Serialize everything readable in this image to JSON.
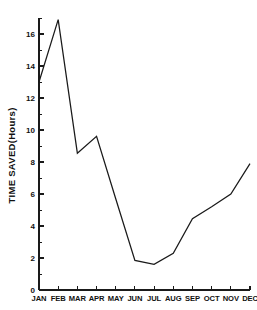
{
  "chart_data": {
    "type": "line",
    "title": "",
    "subtitle": "",
    "xlabel": "",
    "ylabel": "TIME SAVED(Hours)",
    "categories": [
      "JAN",
      "FEB",
      "MAR",
      "APR",
      "MAY",
      "JUN",
      "JUL",
      "AUG",
      "SEP",
      "OCT",
      "NOV",
      "DEC"
    ],
    "values": [
      13.0,
      16.9,
      8.55,
      9.6,
      5.7,
      1.85,
      1.6,
      2.3,
      4.45,
      5.2,
      6.0,
      7.9
    ],
    "series": [
      {
        "name": "Time Saved",
        "values": [
          13.0,
          16.9,
          8.55,
          9.6,
          5.7,
          1.85,
          1.6,
          2.3,
          4.45,
          5.2,
          6.0,
          7.9
        ],
        "color": "#1a1a1a"
      }
    ],
    "ylim": [
      0,
      17
    ],
    "xlim": [
      0,
      11
    ],
    "y_major_ticks": [
      0,
      2,
      4,
      6,
      8,
      10,
      12,
      14,
      16
    ],
    "y_major_tick_labels": [
      "0",
      "2",
      "4",
      "6",
      "8",
      "10",
      "12",
      "14",
      "16"
    ],
    "y_minor_ticks": [
      1,
      3,
      5,
      7,
      9,
      11,
      13,
      15,
      17
    ],
    "grid": false,
    "legend": false,
    "legend_position": "none",
    "line_color": "#1a1a1a",
    "background_color": "#ffffff",
    "annotations": []
  },
  "axes": {
    "y_title": "TIME SAVED(Hours)"
  }
}
